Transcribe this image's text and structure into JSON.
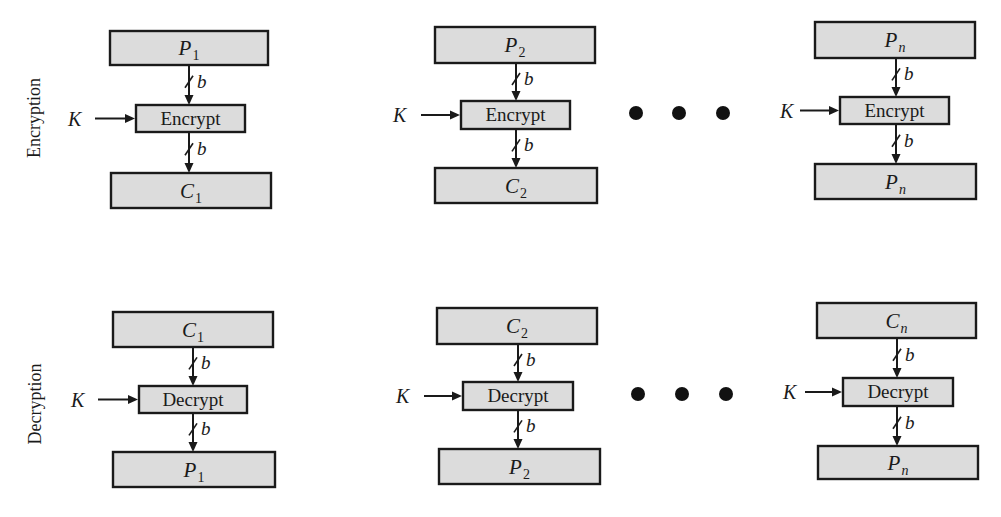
{
  "colors": {
    "box_fill": "#dcdcdc",
    "stroke": "#1a1a1a",
    "background": "#ffffff"
  },
  "rows": [
    {
      "label": "Encryption",
      "label_pos": {
        "x": 40,
        "y": 118
      },
      "ellipsis": {
        "dots": [
          {
            "x": 636,
            "y": 113
          },
          {
            "x": 679,
            "y": 113
          },
          {
            "x": 723,
            "y": 113
          }
        ],
        "r": 7
      },
      "columns": [
        {
          "input": {
            "var": "P",
            "sub": "1",
            "sub_italic": false,
            "x": 110,
            "y": 31,
            "w": 158,
            "h": 34
          },
          "op": {
            "label": "Encrypt",
            "x": 136,
            "y": 105,
            "w": 109,
            "h": 27
          },
          "output": {
            "var": "C",
            "sub": "1",
            "sub_italic": false,
            "x": 111,
            "y": 173,
            "w": 160,
            "h": 35
          },
          "arrow_x": 189,
          "key": {
            "label": "K",
            "text_x": 75,
            "line_from": 95
          }
        },
        {
          "input": {
            "var": "P",
            "sub": "2",
            "sub_italic": false,
            "x": 435,
            "y": 27,
            "w": 160,
            "h": 36
          },
          "op": {
            "label": "Encrypt",
            "x": 461,
            "y": 101,
            "w": 109,
            "h": 28
          },
          "output": {
            "var": "C",
            "sub": "2",
            "sub_italic": false,
            "x": 435,
            "y": 168,
            "w": 162,
            "h": 35
          },
          "arrow_x": 516,
          "key": {
            "label": "K",
            "text_x": 400,
            "line_from": 421
          }
        },
        {
          "input": {
            "var": "P",
            "sub": "n",
            "sub_italic": true,
            "x": 815,
            "y": 22,
            "w": 160,
            "h": 36
          },
          "op": {
            "label": "Encrypt",
            "x": 840,
            "y": 97,
            "w": 109,
            "h": 27
          },
          "output": {
            "var": "P",
            "sub": "n",
            "sub_italic": true,
            "x": 815,
            "y": 164,
            "w": 161,
            "h": 35
          },
          "arrow_x": 896,
          "key": {
            "label": "K",
            "text_x": 787,
            "line_from": 800
          }
        }
      ]
    },
    {
      "label": "Decryption",
      "label_pos": {
        "x": 41,
        "y": 404
      },
      "ellipsis": {
        "dots": [
          {
            "x": 638,
            "y": 394
          },
          {
            "x": 682,
            "y": 394
          },
          {
            "x": 726,
            "y": 394
          }
        ],
        "r": 7
      },
      "columns": [
        {
          "input": {
            "var": "C",
            "sub": "1",
            "sub_italic": false,
            "x": 113,
            "y": 312,
            "w": 160,
            "h": 35
          },
          "op": {
            "label": "Decrypt",
            "x": 139,
            "y": 386,
            "w": 108,
            "h": 27
          },
          "output": {
            "var": "P",
            "sub": "1",
            "sub_italic": false,
            "x": 113,
            "y": 452,
            "w": 162,
            "h": 35
          },
          "arrow_x": 193,
          "key": {
            "label": "K",
            "text_x": 78,
            "line_from": 98
          }
        },
        {
          "input": {
            "var": "C",
            "sub": "2",
            "sub_italic": false,
            "x": 437,
            "y": 308,
            "w": 160,
            "h": 36
          },
          "op": {
            "label": "Decrypt",
            "x": 463,
            "y": 382,
            "w": 110,
            "h": 28
          },
          "output": {
            "var": "P",
            "sub": "2",
            "sub_italic": false,
            "x": 439,
            "y": 449,
            "w": 161,
            "h": 35
          },
          "arrow_x": 518,
          "key": {
            "label": "K",
            "text_x": 403,
            "line_from": 424
          }
        },
        {
          "input": {
            "var": "C",
            "sub": "n",
            "sub_italic": true,
            "x": 817,
            "y": 303,
            "w": 159,
            "h": 35
          },
          "op": {
            "label": "Decrypt",
            "x": 843,
            "y": 378,
            "w": 110,
            "h": 28
          },
          "output": {
            "var": "P",
            "sub": "n",
            "sub_italic": true,
            "x": 818,
            "y": 446,
            "w": 160,
            "h": 33
          },
          "arrow_x": 897,
          "key": {
            "label": "K",
            "text_x": 790,
            "line_from": 805
          }
        }
      ]
    }
  ],
  "bit_width_label": "b"
}
